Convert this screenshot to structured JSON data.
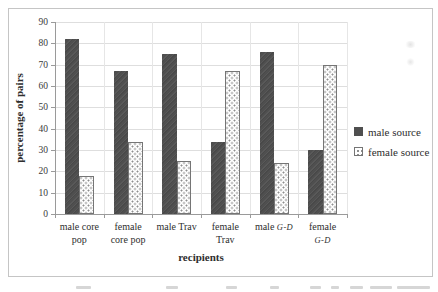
{
  "chart_data": {
    "type": "bar",
    "title": "",
    "xlabel": "recipients",
    "ylabel": "percentage of pairs",
    "ylim": [
      0,
      90
    ],
    "ytick_step": 10,
    "grid": true,
    "legend_position": "right",
    "categories": [
      "male core pop",
      "female core pop",
      "male Trav",
      "female Trav",
      "male G-D",
      "female G-D"
    ],
    "category_label_lines": [
      [
        "male core",
        "pop"
      ],
      [
        "female",
        "core pop"
      ],
      [
        "male Trav"
      ],
      [
        "female",
        "Trav"
      ],
      [
        "male G-D"
      ],
      [
        "female",
        "G-D"
      ]
    ],
    "series": [
      {
        "name": "male source",
        "style": "solid-dark",
        "values": [
          82,
          67,
          75,
          34,
          76,
          30
        ]
      },
      {
        "name": "female source",
        "style": "dotted",
        "values": [
          18,
          34,
          25,
          67,
          24,
          70
        ]
      }
    ],
    "colors": {
      "bar_dark": "#4f4f4f",
      "bar_dotted_dots": "#8d8d8d",
      "grid": "#dedede",
      "axis": "#9a9a9a",
      "text": "#2e2e2e",
      "frame_border": "#c5c5c5"
    }
  }
}
